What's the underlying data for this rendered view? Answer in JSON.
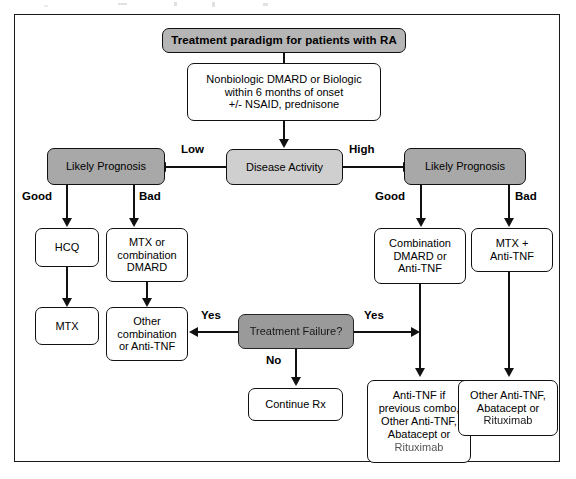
{
  "diagram": {
    "title": "Treatment paradigm for patients with RA",
    "type": "flowchart",
    "nodes": {
      "title_banner": {
        "label": "Treatment paradigm for patients with RA",
        "shape": "rounded-rect",
        "fill": "#b5b5b5"
      },
      "initial_therapy": {
        "line1": "Nonbiologic DMARD or Biologic",
        "line2": "within 6 months of onset",
        "line3": "+/- NSAID, prednisone",
        "shape": "rounded-rect",
        "fill": "#ffffff"
      },
      "disease_activity": {
        "label": "Disease Activity",
        "shape": "rounded-rect",
        "fill": "#cfcfcf"
      },
      "prognosis_low": {
        "label": "Likely Prognosis",
        "shape": "rounded-rect",
        "fill": "#a8a8a8"
      },
      "prognosis_high": {
        "label": "Likely Prognosis",
        "shape": "rounded-rect",
        "fill": "#a8a8a8"
      },
      "hcq": {
        "label": "HCQ",
        "shape": "rounded-rect",
        "fill": "#ffffff"
      },
      "mtx_or_combination": {
        "line1": "MTX or",
        "line2": "combination",
        "line3": "DMARD",
        "shape": "rounded-rect",
        "fill": "#ffffff"
      },
      "mtx": {
        "label": "MTX",
        "shape": "rounded-rect",
        "fill": "#ffffff"
      },
      "other_combination": {
        "line1": "Other",
        "line2": "combination",
        "line3": "or Anti-TNF",
        "shape": "rounded-rect",
        "fill": "#ffffff"
      },
      "treatment_failure": {
        "label": "Treatment Failure?",
        "shape": "rounded-rect",
        "fill": "#a0a0a0"
      },
      "continue_rx": {
        "label": "Continue Rx",
        "shape": "rounded-rect",
        "fill": "#ffffff"
      },
      "combination_dmard": {
        "line1": "Combination",
        "line2": "DMARD or",
        "line3": "Anti-TNF",
        "shape": "rounded-rect",
        "fill": "#ffffff"
      },
      "mtx_plus_antitnf": {
        "line1": "MTX +",
        "line2": "Anti-TNF",
        "shape": "rounded-rect",
        "fill": "#ffffff"
      },
      "antitnf_if_previous": {
        "line1": "Anti-TNF if",
        "line2": "previous combo,",
        "line3": "Other Anti-TNF,",
        "line4": "Abatacept or",
        "line5": "Rituximab",
        "shape": "rounded-rect",
        "fill": "#ffffff"
      },
      "other_antitnf": {
        "line1": "Other Anti-TNF,",
        "line2": "Abatacept or",
        "line3": "Rituximab",
        "shape": "rounded-rect",
        "fill": "#ffffff"
      }
    },
    "edge_labels": {
      "low": "Low",
      "high": "High",
      "good_left": "Good",
      "bad_left": "Bad",
      "good_right": "Good",
      "bad_right": "Bad",
      "yes_left": "Yes",
      "yes_right": "Yes",
      "no": "No"
    }
  }
}
